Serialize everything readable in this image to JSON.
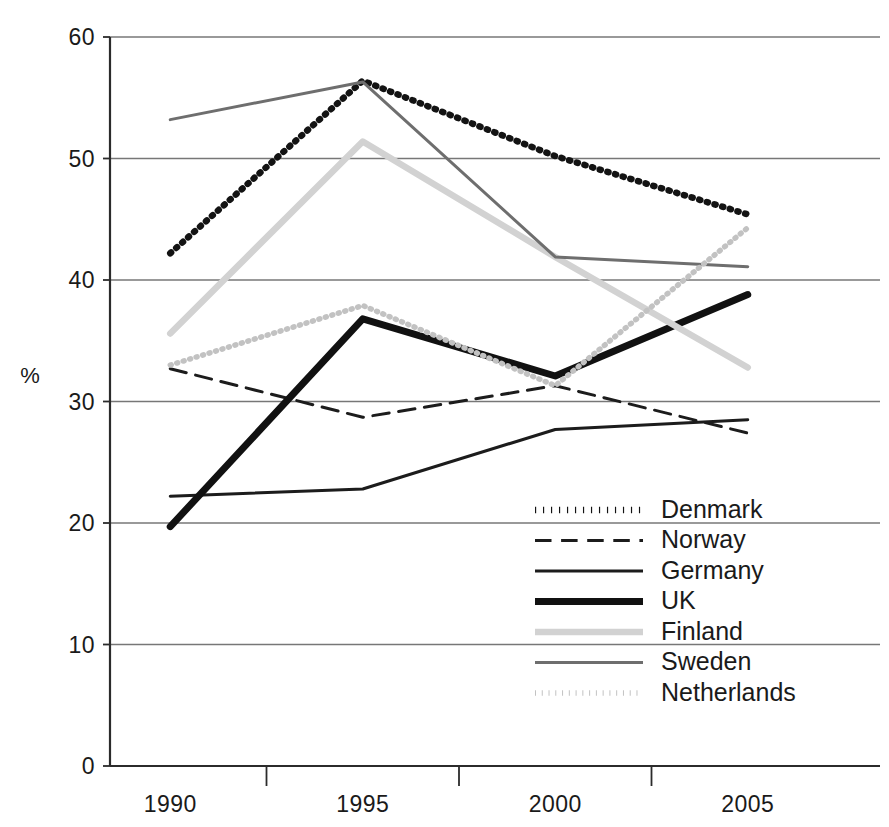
{
  "chart_data": {
    "type": "line",
    "title": "",
    "xlabel": "",
    "ylabel": "%",
    "categories": [
      "1990",
      "1995",
      "2000",
      "2005"
    ],
    "x": [
      1990,
      1995,
      2000,
      2005
    ],
    "ylim": [
      0,
      60
    ],
    "yticks": [
      0,
      10,
      20,
      30,
      40,
      50,
      60
    ],
    "ytick_labels": [
      "0",
      "10",
      "20",
      "30",
      "40",
      "50",
      "60"
    ],
    "grid": "horizontal",
    "legend_position": "inside-lower-right",
    "series": [
      {
        "name": "Denmark",
        "values": [
          42.2,
          56.4,
          50.2,
          45.4
        ],
        "color": "#131313",
        "style": "dotted",
        "width": 6.5
      },
      {
        "name": "Norway",
        "values": [
          32.7,
          28.7,
          31.3,
          27.4
        ],
        "color": "#1c1c1c",
        "style": "dashed",
        "width": 3.0
      },
      {
        "name": "Germany",
        "values": [
          22.2,
          22.8,
          27.7,
          28.5
        ],
        "color": "#1c1c1c",
        "style": "solid",
        "width": 3.0
      },
      {
        "name": "UK",
        "values": [
          19.7,
          36.8,
          32.1,
          38.8
        ],
        "color": "#111111",
        "style": "solid",
        "width": 7.0
      },
      {
        "name": "Finland",
        "values": [
          35.6,
          51.4,
          41.9,
          32.8
        ],
        "color": "#d2d2d2",
        "style": "solid",
        "width": 6.5
      },
      {
        "name": "Sweden",
        "values": [
          53.2,
          56.3,
          41.9,
          41.1
        ],
        "color": "#6e6e6e",
        "style": "solid",
        "width": 3.0
      },
      {
        "name": "Netherlands",
        "values": [
          33.0,
          37.9,
          31.3,
          44.3
        ],
        "color": "#c2c2c2",
        "style": "dotted",
        "width": 5.5
      }
    ]
  },
  "axis": {
    "y_label": "%",
    "y_tick_0": "0",
    "y_tick_10": "10",
    "y_tick_20": "20",
    "y_tick_30": "30",
    "y_tick_40": "40",
    "y_tick_50": "50",
    "y_tick_60": "60",
    "x_tick_1990": "1990",
    "x_tick_1995": "1995",
    "x_tick_2000": "2000",
    "x_tick_2005": "2005"
  },
  "legend": {
    "items": [
      {
        "label": "Denmark"
      },
      {
        "label": "Norway"
      },
      {
        "label": "Germany"
      },
      {
        "label": "UK"
      },
      {
        "label": "Finland"
      },
      {
        "label": "Sweden"
      },
      {
        "label": "Netherlands"
      }
    ]
  }
}
